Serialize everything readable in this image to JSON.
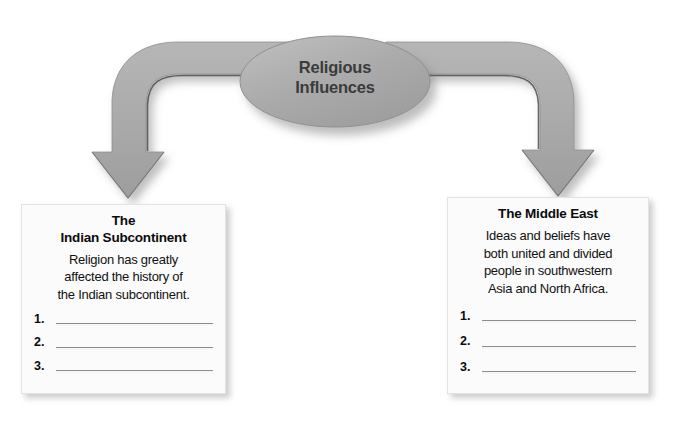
{
  "diagram": {
    "type": "flow-chart-graphic-organizer",
    "center_node": {
      "shape": "oval",
      "lines": [
        "Religious",
        "Influences"
      ],
      "fill_color": "#a8a8a8",
      "text_color": "#3b3b3b"
    },
    "connectors": [
      {
        "name": "arrow-to-left-box",
        "direction": "down-left",
        "style": "curved-elbow-arrow",
        "color": "#a8a8a8"
      },
      {
        "name": "arrow-to-right-box",
        "direction": "down-right",
        "style": "curved-elbow-arrow",
        "color": "#a8a8a8"
      }
    ],
    "boxes": [
      {
        "id": "left",
        "title_lines": [
          "The",
          "Indian Subcontinent"
        ],
        "body_lines": [
          "Religion has greatly",
          "affected the history of",
          "the Indian subcontinent."
        ],
        "blank_lines": [
          "1.",
          "2.",
          "3."
        ],
        "fill_color": "#fbfbfb",
        "rule_color": "#8d8d8d"
      },
      {
        "id": "right",
        "title_lines": [
          "The Middle East"
        ],
        "body_lines": [
          "Ideas and beliefs have",
          "both united and divided",
          "people in southwestern",
          "Asia and North Africa."
        ],
        "blank_lines": [
          "1.",
          "2.",
          "3."
        ],
        "fill_color": "#fbfbfb",
        "rule_color": "#8d8d8d"
      }
    ]
  }
}
